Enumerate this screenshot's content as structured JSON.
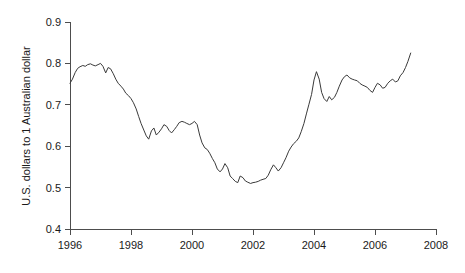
{
  "chart_data": {
    "type": "line",
    "title": "",
    "xlabel": "",
    "ylabel": "U.S. dollars to 1 Australian dollar",
    "xlim": [
      1996.0,
      2008.0
    ],
    "ylim": [
      0.4,
      0.9
    ],
    "grid": false,
    "legend": "none",
    "line_color": "#3a3a3a",
    "axis_color": "#4d4d4d",
    "background_color": "#ffffff",
    "xticks": [
      1996,
      1998,
      2000,
      2002,
      2004,
      2006,
      2008
    ],
    "xtick_labels": [
      "1996",
      "1998",
      "2000",
      "2002",
      "2004",
      "2006",
      "2008"
    ],
    "yticks": [
      0.4,
      0.5,
      0.6,
      0.7,
      0.8,
      0.9
    ],
    "ytick_labels": [
      "0.4",
      "0.5",
      "0.6",
      "0.7",
      "0.8",
      "0.9"
    ],
    "series": [
      {
        "name": "AUD/USD exchange rate",
        "x": [
          1996.0,
          1996.08,
          1996.17,
          1996.25,
          1996.33,
          1996.42,
          1996.5,
          1996.58,
          1996.67,
          1996.75,
          1996.83,
          1996.92,
          1997.0,
          1997.08,
          1997.17,
          1997.25,
          1997.33,
          1997.42,
          1997.5,
          1997.58,
          1997.67,
          1997.75,
          1997.83,
          1997.92,
          1998.0,
          1998.08,
          1998.17,
          1998.25,
          1998.33,
          1998.42,
          1998.5,
          1998.58,
          1998.67,
          1998.75,
          1998.83,
          1998.92,
          1999.0,
          1999.08,
          1999.17,
          1999.25,
          1999.33,
          1999.42,
          1999.5,
          1999.58,
          1999.67,
          1999.75,
          1999.83,
          1999.92,
          2000.0,
          2000.08,
          2000.17,
          2000.25,
          2000.33,
          2000.42,
          2000.5,
          2000.58,
          2000.67,
          2000.75,
          2000.83,
          2000.92,
          2001.0,
          2001.08,
          2001.17,
          2001.25,
          2001.33,
          2001.42,
          2001.5,
          2001.58,
          2001.67,
          2001.75,
          2001.83,
          2001.92,
          2002.0,
          2002.08,
          2002.17,
          2002.25,
          2002.33,
          2002.42,
          2002.5,
          2002.58,
          2002.67,
          2002.75,
          2002.83,
          2002.92,
          2003.0,
          2003.08,
          2003.17,
          2003.25,
          2003.33,
          2003.42,
          2003.5,
          2003.58,
          2003.67,
          2003.75,
          2003.83,
          2003.92,
          2004.0,
          2004.08,
          2004.17,
          2004.25,
          2004.33,
          2004.42,
          2004.5,
          2004.58,
          2004.67,
          2004.75,
          2004.83,
          2004.92,
          2005.0,
          2005.08,
          2005.17,
          2005.25,
          2005.33,
          2005.42,
          2005.5,
          2005.58,
          2005.67,
          2005.75,
          2005.83,
          2005.92,
          2006.0,
          2006.08,
          2006.17,
          2006.25,
          2006.33,
          2006.42,
          2006.5,
          2006.58,
          2006.67,
          2006.75,
          2006.83,
          2006.92,
          2007.0,
          2007.08,
          2007.17
        ],
        "values": [
          0.752,
          0.762,
          0.778,
          0.788,
          0.792,
          0.795,
          0.793,
          0.797,
          0.799,
          0.796,
          0.794,
          0.797,
          0.8,
          0.793,
          0.777,
          0.79,
          0.787,
          0.775,
          0.762,
          0.752,
          0.745,
          0.738,
          0.728,
          0.722,
          0.715,
          0.705,
          0.69,
          0.672,
          0.655,
          0.639,
          0.625,
          0.617,
          0.637,
          0.644,
          0.627,
          0.634,
          0.642,
          0.652,
          0.648,
          0.638,
          0.632,
          0.64,
          0.648,
          0.657,
          0.66,
          0.658,
          0.655,
          0.652,
          0.655,
          0.66,
          0.652,
          0.627,
          0.608,
          0.596,
          0.592,
          0.583,
          0.57,
          0.56,
          0.545,
          0.538,
          0.545,
          0.558,
          0.548,
          0.528,
          0.522,
          0.515,
          0.512,
          0.528,
          0.524,
          0.516,
          0.513,
          0.51,
          0.512,
          0.513,
          0.515,
          0.518,
          0.52,
          0.522,
          0.53,
          0.543,
          0.555,
          0.548,
          0.54,
          0.548,
          0.56,
          0.572,
          0.588,
          0.598,
          0.606,
          0.612,
          0.62,
          0.635,
          0.655,
          0.678,
          0.7,
          0.725,
          0.76,
          0.78,
          0.762,
          0.73,
          0.715,
          0.708,
          0.72,
          0.712,
          0.718,
          0.73,
          0.745,
          0.76,
          0.768,
          0.772,
          0.765,
          0.762,
          0.76,
          0.758,
          0.752,
          0.748,
          0.745,
          0.742,
          0.735,
          0.73,
          0.742,
          0.752,
          0.748,
          0.74,
          0.742,
          0.752,
          0.758,
          0.762,
          0.755,
          0.758,
          0.77,
          0.778,
          0.79,
          0.805,
          0.825
        ]
      }
    ]
  }
}
